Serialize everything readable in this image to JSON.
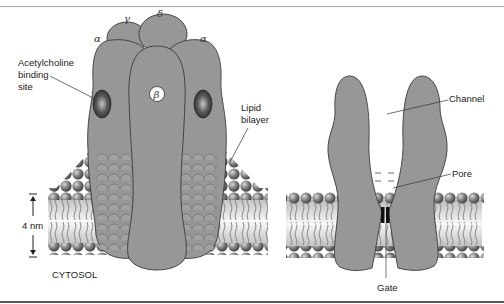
{
  "figure": {
    "left_panel": {
      "title": "Acetylcholine receptor in lipid bilayer",
      "subunit_labels": {
        "alpha_left": "α",
        "gamma": "γ",
        "delta": "δ",
        "alpha_right": "α",
        "beta": "β"
      },
      "labels": {
        "binding_site_line1": "Acetylcholine",
        "binding_site_line2": "binding",
        "binding_site_line3": "site",
        "lipid_line1": "Lipid",
        "lipid_line2": "bilayer",
        "scale": "4 nm",
        "cytosol": "CYTOSOL"
      }
    },
    "right_panel": {
      "title": "Cross-section of channel",
      "labels": {
        "channel": "Channel",
        "pore": "Pore",
        "gate": "Gate"
      }
    },
    "colors": {
      "protein": "#979797",
      "protein_stroke": "#3a3a3a",
      "lipid_head": "#6e6e6e",
      "binding_site": "#3c3c3c",
      "gate": "#111111"
    }
  }
}
